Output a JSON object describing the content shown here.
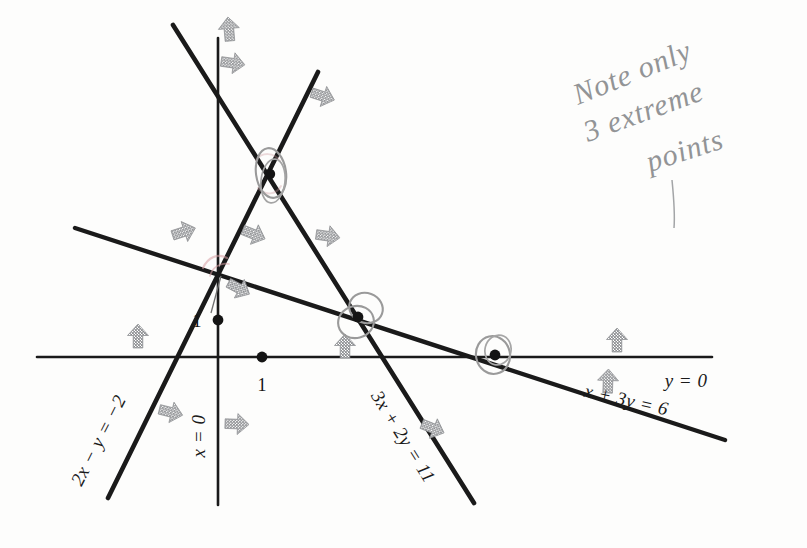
{
  "figure": {
    "background_color": "#fdfdfc",
    "line_color": "#1a1a1a",
    "axis_color": "#1a1a1a",
    "arrow_color": "#8f9194",
    "annotation_color": "#8d8f91",
    "circle_color": "#9a9a9a",
    "pink_mark_color": "#d8a0a4"
  },
  "axes": {
    "x_axis_label": "y = 0",
    "y_axis_label": "x = 0",
    "x_tick_label": "1",
    "y_tick_label": "1",
    "origin_px": [
      218,
      357
    ],
    "x_unit_px": 44,
    "y_unit_px": 38
  },
  "lines": [
    {
      "id": "line-2x-y",
      "label": "2x − y = −2",
      "equation": "2x - y = -2",
      "slope": 2,
      "intercept": 2,
      "label_rotation_deg": -63
    },
    {
      "id": "line-3x-2y",
      "label": "3x + 2y = 11",
      "equation": "3x + 2y = 11",
      "slope": -1.5,
      "intercept": 5.5,
      "label_rotation_deg": 56
    },
    {
      "id": "line-x-3y",
      "label": "x + 3y = 6",
      "equation": "x + 3y = 6",
      "slope": -0.3333,
      "intercept": 2,
      "label_rotation_deg": 13
    },
    {
      "id": "line-y-0",
      "label": "y = 0",
      "equation": "y = 0",
      "slope": 0,
      "intercept": 0,
      "label_rotation_deg": 0
    },
    {
      "id": "line-x-0",
      "label": "x = 0",
      "equation": "x = 0",
      "slope": null,
      "intercept": null,
      "label_rotation_deg": -90
    }
  ],
  "extreme_points": [
    {
      "id": "extreme-point-top",
      "circled": true,
      "px": [
        270,
        174
      ]
    },
    {
      "id": "extreme-point-middle",
      "circled": true,
      "px": [
        358,
        317
      ]
    },
    {
      "id": "extreme-point-right",
      "circled": true,
      "px": [
        495,
        355
      ]
    }
  ],
  "plot_dots": [
    {
      "id": "dot-y-unit",
      "px": [
        218,
        320
      ]
    },
    {
      "id": "dot-x-unit",
      "px": [
        262,
        357
      ]
    }
  ],
  "feasibility_arrows": [
    {
      "id": "arrow-1",
      "px": [
        229,
        30
      ],
      "rot": 95
    },
    {
      "id": "arrow-2",
      "px": [
        232,
        63
      ],
      "rot": 95
    },
    {
      "id": "arrow-3",
      "px": [
        322,
        96
      ],
      "rot": 110
    },
    {
      "id": "arrow-4",
      "px": [
        183,
        232
      ],
      "rot": 72
    },
    {
      "id": "arrow-5",
      "px": [
        253,
        234
      ],
      "rot": 130
    },
    {
      "id": "arrow-6",
      "px": [
        327,
        236
      ],
      "rot": 95
    },
    {
      "id": "arrow-7",
      "px": [
        238,
        288
      ],
      "rot": 125
    },
    {
      "id": "arrow-8",
      "px": [
        138,
        337
      ],
      "rot": 0
    },
    {
      "id": "arrow-9",
      "px": [
        345,
        347
      ],
      "rot": 0
    },
    {
      "id": "arrow-10",
      "px": [
        617,
        341
      ],
      "rot": 0
    },
    {
      "id": "arrow-11",
      "px": [
        170,
        412
      ],
      "rot": 110
    },
    {
      "id": "arrow-12",
      "px": [
        236,
        424
      ],
      "rot": 95
    },
    {
      "id": "arrow-13",
      "px": [
        432,
        428
      ],
      "rot": 60
    },
    {
      "id": "arrow-14",
      "px": [
        608,
        382
      ],
      "rot": 0
    }
  ],
  "handwritten_note": {
    "id": "note-extreme-points",
    "line1": "Note only",
    "line2": "3 extreme",
    "line3": "points",
    "px": [
      578,
      100
    ]
  }
}
